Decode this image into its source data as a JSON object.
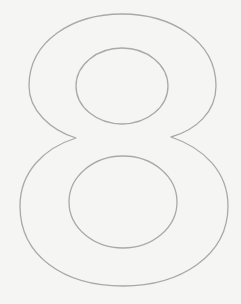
{
  "figure": {
    "character": "8",
    "stroke_color": "#a9a9a9",
    "background_color": "#f5f5f4"
  }
}
